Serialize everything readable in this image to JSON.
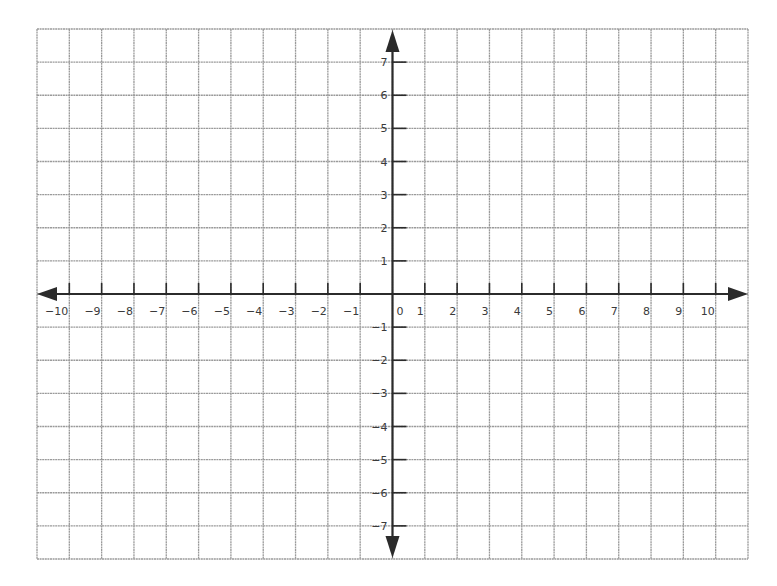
{
  "chart_data": {
    "type": "scatter",
    "title": "",
    "xlabel": "",
    "ylabel": "",
    "xlim": [
      -11,
      11
    ],
    "ylim": [
      -8,
      8
    ],
    "grid": true,
    "x_ticks": [
      -10,
      -9,
      -8,
      -7,
      -6,
      -5,
      -4,
      -3,
      -2,
      -1,
      0,
      1,
      2,
      3,
      4,
      5,
      6,
      7,
      8,
      9,
      10
    ],
    "y_ticks": [
      -7,
      -6,
      -5,
      -4,
      -3,
      -2,
      -1,
      1,
      2,
      3,
      4,
      5,
      6,
      7
    ],
    "origin_label": "0",
    "series": []
  },
  "colors": {
    "grid": "#9a9a9a",
    "axis": "#2b2b2b",
    "label": "#3a3a3a",
    "background": "#ffffff"
  },
  "layout": {
    "left": 37,
    "right": 748,
    "top": 29,
    "bottom": 559,
    "cols": 22,
    "rows": 16,
    "origin_col": 11,
    "origin_row": 8
  }
}
